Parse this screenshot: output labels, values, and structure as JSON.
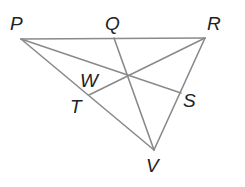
{
  "diagram": {
    "type": "triangle-cevians",
    "colors": {
      "line": "#8a8a8a",
      "label": "#222222",
      "background": "#ffffff"
    },
    "points": {
      "P": {
        "label": "P",
        "x": 21,
        "y": 39
      },
      "Q": {
        "label": "Q",
        "x": 114,
        "y": 38
      },
      "R": {
        "label": "R",
        "x": 205,
        "y": 38
      },
      "S": {
        "label": "S",
        "x": 181,
        "y": 93
      },
      "T": {
        "label": "T",
        "x": 89,
        "y": 95
      },
      "V": {
        "label": "V",
        "x": 154,
        "y": 150
      },
      "W": {
        "label": "W",
        "x": 127,
        "y": 76
      }
    },
    "segments": [
      [
        "P",
        "R"
      ],
      [
        "R",
        "V"
      ],
      [
        "P",
        "V"
      ],
      [
        "P",
        "S"
      ],
      [
        "Q",
        "V"
      ],
      [
        "R",
        "T"
      ]
    ]
  }
}
